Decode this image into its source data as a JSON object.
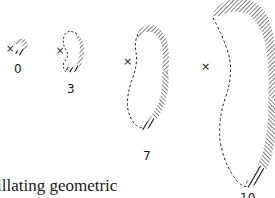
{
  "figure": {
    "panels": [
      {
        "label": "0"
      },
      {
        "label": "3"
      },
      {
        "label": "7"
      },
      {
        "label": "10"
      }
    ],
    "marker_glyph": "×",
    "ink_color": "#1a1a1a"
  },
  "caption": {
    "text": "illating geometric"
  }
}
